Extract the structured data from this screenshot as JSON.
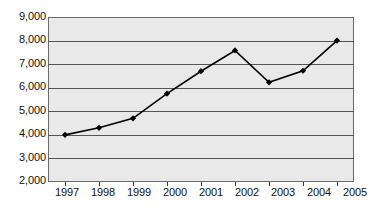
{
  "chart_data": {
    "type": "line",
    "title": "",
    "subtitle": "",
    "xlabel": "",
    "ylabel": "",
    "categories": [
      "1997",
      "1998",
      "1999",
      "2000",
      "2001",
      "2002",
      "2003",
      "2004",
      "2005"
    ],
    "values": [
      4000,
      4300,
      4700,
      5750,
      6700,
      7580,
      6230,
      6720,
      8000
    ],
    "series": [
      {
        "name": "",
        "values": [
          4000,
          4300,
          4700,
          5750,
          6700,
          7580,
          6230,
          6720,
          8000
        ]
      }
    ],
    "ylim": [
      2000,
      9000
    ],
    "ytick_values": [
      9000,
      8000,
      7000,
      6000,
      5000,
      4000,
      3000,
      2000
    ],
    "ytick_labels": [
      "9,000",
      "8,000",
      "7,000",
      "6,000",
      "5,000",
      "4,000",
      "3,000",
      "2,000"
    ],
    "xtick_labels": [
      "1997",
      "1998",
      "1999",
      "2000",
      "2001",
      "2002",
      "2003",
      "2004",
      "2005"
    ],
    "grid": true,
    "grid_axis": "y",
    "legend": false,
    "legend_position": "none",
    "marker": "diamond",
    "colors": {
      "line": "#000000",
      "marker": "#000000",
      "plot_background": "#e9e9e9",
      "grid": "#555555",
      "axis": "#3a3a3a",
      "text": "#111111",
      "page_background": "#ffffff"
    }
  }
}
